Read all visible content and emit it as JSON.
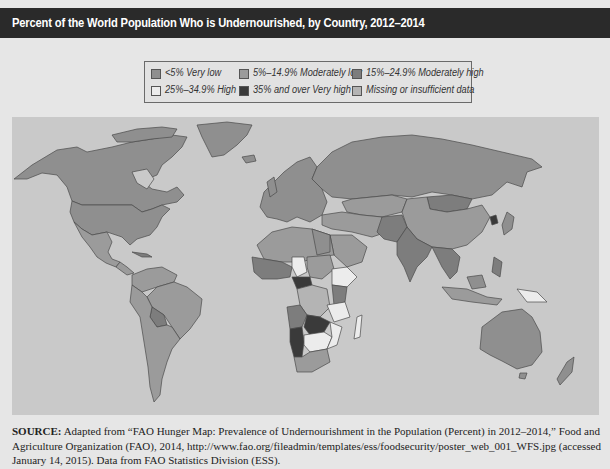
{
  "title": "Percent of the World Population Who is Undernourished, by Country, 2012–2014",
  "legend": {
    "items": [
      {
        "label": "<5% Very low",
        "color": "#8f8f8f"
      },
      {
        "label": "5%–14.9% Moderately low",
        "color": "#9b9b9b"
      },
      {
        "label": "15%–24.9% Moderately high",
        "color": "#7d7d7d"
      },
      {
        "label": "25%–34.9% High",
        "color": "#ececec"
      },
      {
        "label": "35% and over Very high",
        "color": "#3a3a3a"
      },
      {
        "label": "Missing or insufficient data",
        "color": "#b4b4b4"
      }
    ]
  },
  "map": {
    "ocean_color": "#c9c9c9",
    "description": "World choropleth map of undernourishment prevalence by country"
  },
  "source": {
    "label": "SOURCE:",
    "text": " Adapted from “FAO Hunger Map: Prevalence of Undernourishment in the Population (Percent) in 2012–2014,” Food and Agriculture Organization (FAO), 2014, http://www.fao.org/fileadmin/templates/ess/foodsecurity/poster_web_001_WFS.jpg (accessed January 14, 2015). Data from FAO Statistics Division (ESS)."
  }
}
